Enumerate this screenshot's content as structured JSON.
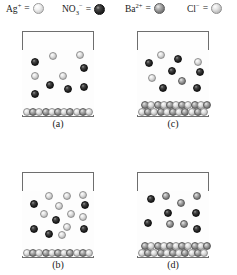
{
  "figure": {
    "type": "chemistry-particulate-diagram",
    "width": 237,
    "height": 275
  },
  "legend": {
    "items": [
      {
        "id": "ag",
        "name": "silver-ion",
        "formula_html": "Ag<sup>+</sup>",
        "label": "Ag+",
        "equals": "=",
        "sphere": "s-white",
        "color": "#e8e8e8",
        "x": 6,
        "sphere_x": 36,
        "size": 11
      },
      {
        "id": "no3",
        "name": "nitrate-ion",
        "formula_html": "NO<sub>3</sub><sup>−</sup>",
        "label": "NO3-",
        "equals": "=",
        "sphere": "s-dark",
        "color": "#1a1a1a",
        "x": 62,
        "sphere_x": 101,
        "size": 11
      },
      {
        "id": "ba",
        "name": "barium-ion",
        "formula_html": "Ba<sup>2+</sup>",
        "label": "Ba2+",
        "equals": "=",
        "sphere": "s-mid",
        "color": "#7e7e7e",
        "x": 125,
        "sphere_x": 164,
        "size": 11
      },
      {
        "id": "cl",
        "name": "chloride-ion",
        "formula_html": "Cl<sup>−</sup>",
        "label": "Cl-",
        "equals": "=",
        "sphere": "s-light",
        "color": "#d4d4d4",
        "x": 187,
        "sphere_x": 215,
        "size": 11
      }
    ]
  },
  "beakers": [
    {
      "id": "a",
      "name": "beaker-a",
      "label": "(a)",
      "x": 22,
      "y": 31,
      "w": 72,
      "h": 86,
      "label_y": 118,
      "liquid_line_y": 19,
      "particles": [
        {
          "cx": 13,
          "cy": 31,
          "r": 4.4,
          "tone": "s-dark"
        },
        {
          "cx": 31,
          "cy": 25,
          "r": 4.4,
          "tone": "s-light"
        },
        {
          "cx": 58,
          "cy": 24,
          "r": 4.4,
          "tone": "s-light"
        },
        {
          "cx": 13,
          "cy": 45,
          "r": 4.4,
          "tone": "s-light"
        },
        {
          "cx": 62,
          "cy": 37,
          "r": 4.4,
          "tone": "s-dark"
        },
        {
          "cx": 41,
          "cy": 45,
          "r": 4.4,
          "tone": "s-light"
        },
        {
          "cx": 28,
          "cy": 54,
          "r": 4.4,
          "tone": "s-dark"
        },
        {
          "cx": 46,
          "cy": 58,
          "r": 4.4,
          "tone": "s-dark"
        },
        {
          "cx": 62,
          "cy": 56,
          "r": 4.4,
          "tone": "s-dark"
        },
        {
          "cx": 13,
          "cy": 63,
          "r": 4.4,
          "tone": "s-dark"
        }
      ],
      "precipitate": {
        "rows": 1,
        "y": 70,
        "h": 15,
        "count": 11,
        "tone_a": "s-light",
        "tone_b": "s-mid"
      }
    },
    {
      "id": "c",
      "name": "beaker-c",
      "label": "(c)",
      "x": 137,
      "y": 31,
      "w": 72,
      "h": 86,
      "label_y": 118,
      "liquid_line_y": 19,
      "particles": [
        {
          "cx": 24,
          "cy": 24,
          "r": 4.4,
          "tone": "s-light"
        },
        {
          "cx": 12,
          "cy": 32,
          "r": 4.4,
          "tone": "s-dark"
        },
        {
          "cx": 41,
          "cy": 28,
          "r": 4.4,
          "tone": "s-dark"
        },
        {
          "cx": 61,
          "cy": 31,
          "r": 4.4,
          "tone": "s-light"
        },
        {
          "cx": 35,
          "cy": 40,
          "r": 4.4,
          "tone": "s-dark"
        },
        {
          "cx": 63,
          "cy": 41,
          "r": 4.4,
          "tone": "s-dark"
        },
        {
          "cx": 15,
          "cy": 47,
          "r": 4.4,
          "tone": "s-light"
        },
        {
          "cx": 45,
          "cy": 50,
          "r": 4.4,
          "tone": "s-mid"
        },
        {
          "cx": 26,
          "cy": 57,
          "r": 4.4,
          "tone": "s-dark"
        },
        {
          "cx": 60,
          "cy": 57,
          "r": 4.4,
          "tone": "s-dark"
        }
      ],
      "precipitate": {
        "rows": 2,
        "y": 63,
        "h": 22,
        "count": 11,
        "tone_a": "s-light",
        "tone_b": "s-mid"
      }
    },
    {
      "id": "b",
      "name": "beaker-b",
      "label": "(b)",
      "x": 22,
      "y": 172,
      "w": 72,
      "h": 86,
      "label_y": 259,
      "liquid_line_y": 19,
      "particles": [
        {
          "cx": 27,
          "cy": 24,
          "r": 4.4,
          "tone": "s-light"
        },
        {
          "cx": 45,
          "cy": 24,
          "r": 4.4,
          "tone": "s-light"
        },
        {
          "cx": 61,
          "cy": 23,
          "r": 4.4,
          "tone": "s-light"
        },
        {
          "cx": 12,
          "cy": 32,
          "r": 4.4,
          "tone": "s-dark"
        },
        {
          "cx": 63,
          "cy": 33,
          "r": 4.4,
          "tone": "s-dark"
        },
        {
          "cx": 37,
          "cy": 34,
          "r": 4.4,
          "tone": "s-light"
        },
        {
          "cx": 22,
          "cy": 42,
          "r": 4.4,
          "tone": "s-light"
        },
        {
          "cx": 49,
          "cy": 42,
          "r": 4.4,
          "tone": "s-light"
        },
        {
          "cx": 61,
          "cy": 45,
          "r": 4.4,
          "tone": "s-light"
        },
        {
          "cx": 34,
          "cy": 48,
          "r": 4.4,
          "tone": "s-dark"
        },
        {
          "cx": 45,
          "cy": 55,
          "r": 4.4,
          "tone": "s-light"
        },
        {
          "cx": 12,
          "cy": 57,
          "r": 4.4,
          "tone": "s-dark"
        },
        {
          "cx": 62,
          "cy": 57,
          "r": 4.4,
          "tone": "s-dark"
        },
        {
          "cx": 27,
          "cy": 62,
          "r": 4.4,
          "tone": "s-dark"
        },
        {
          "cx": 40,
          "cy": 63,
          "r": 4.4,
          "tone": "s-light"
        }
      ],
      "precipitate": {
        "rows": 1,
        "y": 70,
        "h": 15,
        "count": 11,
        "tone_a": "s-light",
        "tone_b": "s-mid"
      }
    },
    {
      "id": "d",
      "name": "beaker-d",
      "label": "(d)",
      "x": 137,
      "y": 172,
      "w": 72,
      "h": 86,
      "label_y": 259,
      "liquid_line_y": 19,
      "particles": [
        {
          "cx": 14,
          "cy": 27,
          "r": 4.4,
          "tone": "s-dark"
        },
        {
          "cx": 29,
          "cy": 24,
          "r": 4.4,
          "tone": "s-mid"
        },
        {
          "cx": 60,
          "cy": 24,
          "r": 4.4,
          "tone": "s-mid"
        },
        {
          "cx": 44,
          "cy": 31,
          "r": 4.4,
          "tone": "s-mid"
        },
        {
          "cx": 31,
          "cy": 41,
          "r": 4.4,
          "tone": "s-dark"
        },
        {
          "cx": 59,
          "cy": 41,
          "r": 4.4,
          "tone": "s-dark"
        },
        {
          "cx": 11,
          "cy": 51,
          "r": 4.4,
          "tone": "s-dark"
        },
        {
          "cx": 33,
          "cy": 52,
          "r": 4.4,
          "tone": "s-mid"
        },
        {
          "cx": 47,
          "cy": 52,
          "r": 4.4,
          "tone": "s-mid"
        },
        {
          "cx": 60,
          "cy": 57,
          "r": 4.4,
          "tone": "s-dark"
        }
      ],
      "precipitate": {
        "rows": 2,
        "y": 63,
        "h": 22,
        "count": 11,
        "tone_a": "s-light",
        "tone_b": "s-mid"
      }
    }
  ]
}
